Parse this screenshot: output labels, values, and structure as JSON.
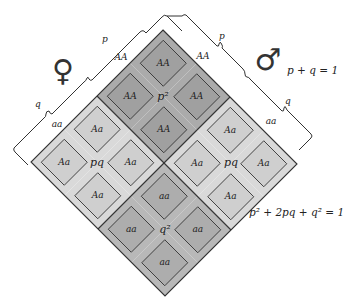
{
  "figure": {
    "female_symbol": "♀",
    "male_symbol": "♂",
    "female_axis": {
      "p_label": "p",
      "q_label": "q"
    },
    "male_axis": {
      "p_label": "p",
      "q_label": "q"
    },
    "edge_labels": {
      "female_p": "AA",
      "female_q": "aa",
      "male_p": "AA",
      "male_q": "aa"
    },
    "equations": {
      "allele_sum": "p + q = 1",
      "genotype_sum": "p² + 2pq + q² = 1"
    },
    "regions": {
      "p2": {
        "label": "p²",
        "cell_label": "AA",
        "color": "#a9a9a9"
      },
      "pq_left": {
        "label": "pq",
        "cell_label": "Aa",
        "color": "#d6d6d6"
      },
      "pq_right": {
        "label": "pq",
        "cell_label": "Aa",
        "color": "#d6d6d6"
      },
      "q2": {
        "label": "q²",
        "cell_label": "aa",
        "color": "#b4b4b4"
      }
    },
    "colors": {
      "p2_outer": "#ababab",
      "p2_inner": "#a0a0a0",
      "pq_outer": "#d9d9d9",
      "pq_inner": "#cfcfcf",
      "q2_outer": "#b8b8b8",
      "q2_inner": "#adadad",
      "line": "#333333"
    }
  }
}
